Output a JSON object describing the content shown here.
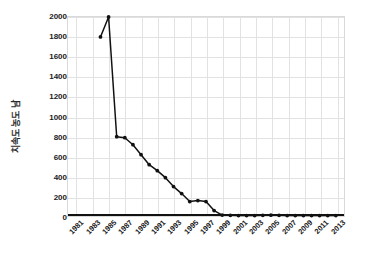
{
  "chart_data": {
    "type": "line",
    "title": "",
    "xlabel": "",
    "ylabel": "치속도 농도 남",
    "ylim": [
      0,
      2000
    ],
    "ytick_step": 200,
    "yticks": [
      0,
      200,
      400,
      600,
      800,
      1000,
      1200,
      1400,
      1600,
      1800,
      2000
    ],
    "xlim": [
      1980,
      2014
    ],
    "xticks": [
      1981,
      1983,
      1985,
      1987,
      1989,
      1991,
      1993,
      1995,
      1997,
      1999,
      2001,
      2003,
      2005,
      2007,
      2009,
      2011,
      2013
    ],
    "grid": true,
    "legend": false,
    "marker": "circle",
    "line_color": "#111111",
    "marker_color": "#111111",
    "grid_color": "#e2e2e2",
    "x": [
      1984,
      1985,
      1986,
      1987,
      1988,
      1989,
      1990,
      1991,
      1992,
      1993,
      1994,
      1995,
      1996,
      1997,
      1998,
      1999,
      2000,
      2001,
      2002,
      2003,
      2004,
      2005,
      2006,
      2007,
      2008,
      2009,
      2010,
      2011,
      2012,
      2013
    ],
    "values": [
      1800,
      2000,
      800,
      790,
      720,
      620,
      520,
      460,
      390,
      300,
      230,
      150,
      160,
      150,
      60,
      15,
      12,
      10,
      10,
      10,
      12,
      14,
      12,
      10,
      10,
      10,
      10,
      10,
      10,
      10
    ],
    "series": [
      {
        "name": "series-1",
        "values": [
          1800,
          2000,
          800,
          790,
          720,
          620,
          520,
          460,
          390,
          300,
          230,
          150,
          160,
          150,
          60,
          15,
          12,
          10,
          10,
          10,
          12,
          14,
          12,
          10,
          10,
          10,
          10,
          10,
          10,
          10
        ]
      }
    ]
  }
}
